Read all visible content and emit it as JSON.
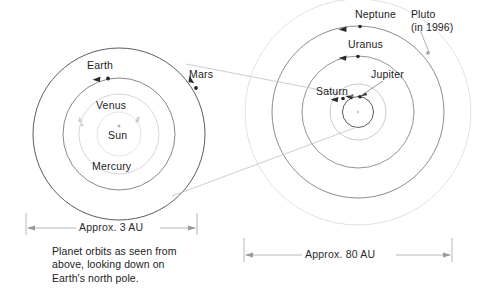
{
  "diagram": {
    "title": "Planet orbits as seen from above, looking down on Earth's north pole.",
    "caption": "Planet orbits as seen from\nabove, looking down on\nEarth's north pole.",
    "inner_system": {
      "scale_label": "Approx. 3 AU",
      "center_label": "Sun",
      "planets": [
        {
          "name": "Mercury",
          "orbit_radius_au": 0.39
        },
        {
          "name": "Venus",
          "orbit_radius_au": 0.72
        },
        {
          "name": "Earth",
          "orbit_radius_au": 1.0
        },
        {
          "name": "Mars",
          "orbit_radius_au": 1.52
        }
      ]
    },
    "outer_system": {
      "scale_label": "Approx. 80 AU",
      "planets": [
        {
          "name": "Jupiter",
          "orbit_radius_au": 5.2
        },
        {
          "name": "Saturn",
          "orbit_radius_au": 9.5
        },
        {
          "name": "Uranus",
          "orbit_radius_au": 19.2
        },
        {
          "name": "Neptune",
          "orbit_radius_au": 30.1
        },
        {
          "name": "Pluto",
          "orbit_radius_au": 39.5,
          "note": "(in 1996)"
        }
      ]
    },
    "labels": {
      "sun": "Sun",
      "mercury": "Mercury",
      "venus": "Venus",
      "earth": "Earth",
      "mars": "Mars",
      "jupiter": "Jupiter",
      "saturn": "Saturn",
      "uranus": "Uranus",
      "neptune": "Neptune",
      "pluto": "Pluto",
      "pluto_note": "(in 1996)",
      "pluto_full": "Pluto\n(in 1996)",
      "scale_inner": "Approx. 3 AU",
      "scale_outer": "Approx. 80 AU"
    },
    "colors": {
      "orbit_dark": "#4a4a4a",
      "orbit_mid": "#8c8c8c",
      "orbit_light": "#c2c2c2",
      "orbit_faint": "#d8d8d8",
      "text": "#1c1c1c",
      "leader": "#b8b8b8",
      "dimension": "#8f8f8f",
      "background": "#ffffff"
    }
  }
}
